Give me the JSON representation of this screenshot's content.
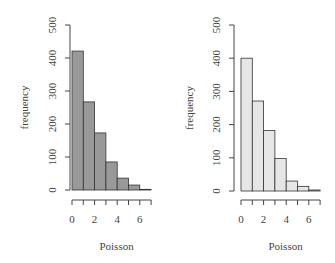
{
  "chart_data": [
    {
      "type": "bar",
      "title": "",
      "xlabel": "Poisson",
      "ylabel": "frequency",
      "categories": [
        "0",
        "1",
        "2",
        "3",
        "4",
        "5",
        "6"
      ],
      "bin_edges": [
        0,
        1,
        2,
        3,
        4,
        5,
        6,
        7
      ],
      "values": [
        421,
        267,
        173,
        85,
        36,
        15,
        2
      ],
      "ylim": [
        0,
        500
      ],
      "yticks": [
        0,
        100,
        200,
        300,
        400,
        500
      ],
      "xticks": [
        0,
        2,
        4,
        6
      ],
      "fill": "#999999",
      "edge": "#333333",
      "grid": false
    },
    {
      "type": "bar",
      "title": "",
      "xlabel": "Poisson",
      "ylabel": "frequency",
      "categories": [
        "0",
        "1",
        "2",
        "3",
        "4",
        "5",
        "6"
      ],
      "bin_edges": [
        0,
        1,
        2,
        3,
        4,
        5,
        6,
        7
      ],
      "values": [
        400,
        271,
        182,
        98,
        30,
        14,
        3
      ],
      "ylim": [
        0,
        500
      ],
      "yticks": [
        0,
        100,
        200,
        300,
        400,
        500
      ],
      "xticks": [
        0,
        2,
        4,
        6
      ],
      "fill": "#e6e6e6",
      "edge": "#333333",
      "grid": false
    }
  ]
}
